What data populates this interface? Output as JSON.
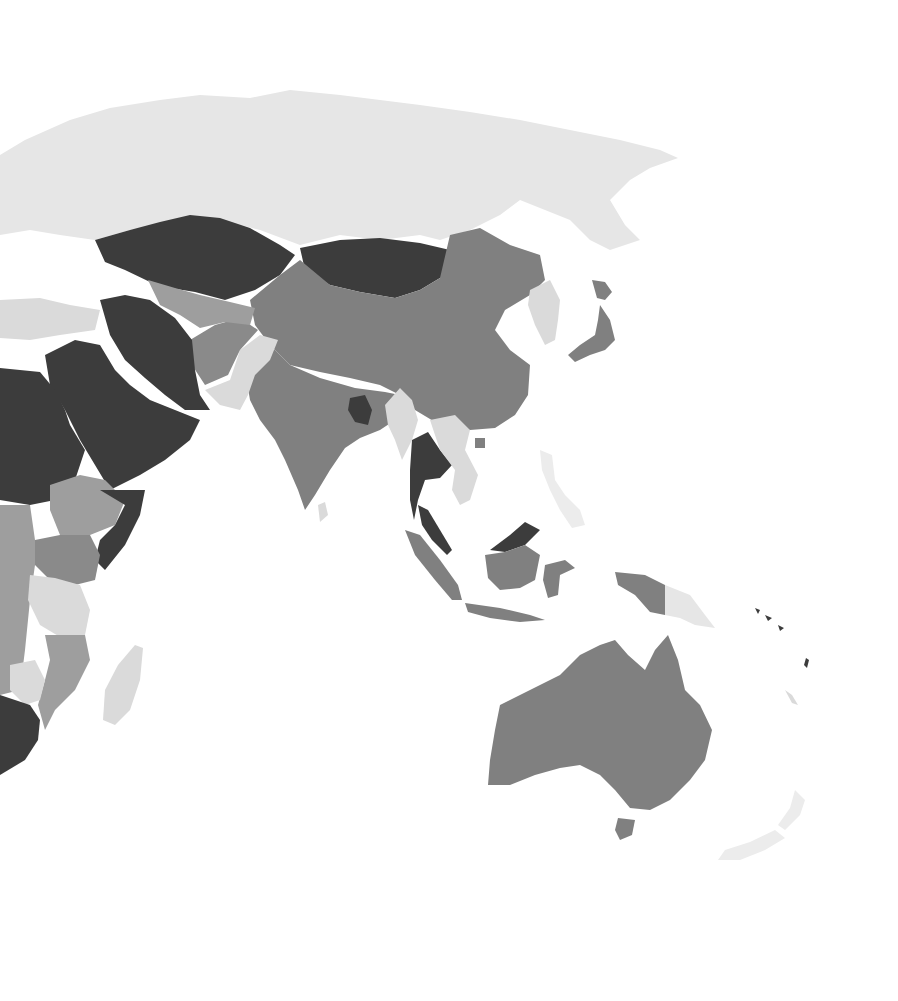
{
  "map": {
    "type": "choropleth",
    "projection": "world (Asia-Pacific view)",
    "background": "#ffffff",
    "shades": {
      "darkest": "#3c3c3c",
      "dark": "#808080",
      "medium": "#9e9e9e",
      "light": "#dadada",
      "lightest": "#ececec"
    },
    "regions": [
      {
        "name": "Russia",
        "shade": "#e6e6e6"
      },
      {
        "name": "Kazakhstan",
        "shade": "#3c3c3c"
      },
      {
        "name": "Mongolia",
        "shade": "#3c3c3c"
      },
      {
        "name": "China",
        "shade": "#808080"
      },
      {
        "name": "India",
        "shade": "#808080"
      },
      {
        "name": "Pakistan",
        "shade": "#dadada"
      },
      {
        "name": "Afghanistan",
        "shade": "#8a8a8a"
      },
      {
        "name": "Iran",
        "shade": "#3c3c3c"
      },
      {
        "name": "Saudi Arabia",
        "shade": "#3c3c3c"
      },
      {
        "name": "Egypt",
        "shade": "#3c3c3c"
      },
      {
        "name": "Turkey",
        "shade": "#dadada"
      },
      {
        "name": "Central Asia",
        "shade": "#9e9e9e"
      },
      {
        "name": "Bangladesh",
        "shade": "#3c3c3c"
      },
      {
        "name": "Myanmar",
        "shade": "#dadada"
      },
      {
        "name": "Thailand",
        "shade": "#3c3c3c"
      },
      {
        "name": "Vietnam",
        "shade": "#dadada"
      },
      {
        "name": "Malaysia",
        "shade": "#3c3c3c"
      },
      {
        "name": "Indonesia",
        "shade": "#808080"
      },
      {
        "name": "Papua New Guinea",
        "shade": "#e6e6e6"
      },
      {
        "name": "Philippines",
        "shade": "#ececec"
      },
      {
        "name": "Korea",
        "shade": "#dadada"
      },
      {
        "name": "Japan",
        "shade": "#808080"
      },
      {
        "name": "Australia",
        "shade": "#808080"
      },
      {
        "name": "New Zealand",
        "shade": "#ececec"
      },
      {
        "name": "Ethiopia",
        "shade": "#9e9e9e"
      },
      {
        "name": "Somalia",
        "shade": "#3c3c3c"
      },
      {
        "name": "Sudan",
        "shade": "#dadada"
      },
      {
        "name": "Kenya",
        "shade": "#8a8a8a"
      },
      {
        "name": "Tanzania",
        "shade": "#dadada"
      },
      {
        "name": "Mozambique",
        "shade": "#9e9e9e"
      },
      {
        "name": "Zimbabwe",
        "shade": "#dadada"
      },
      {
        "name": "South Africa",
        "shade": "#3c3c3c"
      },
      {
        "name": "Madagascar",
        "shade": "#dadada"
      },
      {
        "name": "Sri Lanka",
        "shade": "#dadada"
      }
    ]
  }
}
